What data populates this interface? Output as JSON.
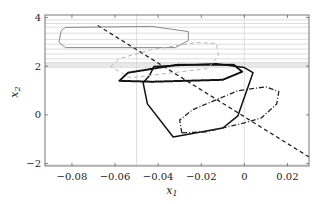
{
  "chart_data": {
    "type": "line",
    "title": "",
    "xlabel": "x_1",
    "ylabel": "x_2",
    "xlim": [
      -0.0925,
      0.03
    ],
    "ylim": [
      -2.1,
      4.1
    ],
    "grid": false,
    "legend": null,
    "x_ticks": [
      "−0.08",
      "−0.06",
      "−0.04",
      "−0.02",
      "0",
      "0.02"
    ],
    "x_tick_values": [
      -0.08,
      -0.06,
      -0.04,
      -0.02,
      0,
      0.02
    ],
    "y_ticks": [
      "−2",
      "0",
      "2",
      "4"
    ],
    "y_tick_values": [
      -2,
      0,
      2,
      4
    ],
    "series": [
      {
        "name": "black solid polygon",
        "style": "solid",
        "color": "#111111",
        "closed": true,
        "points": [
          [
            -0.042,
            1.98
          ],
          [
            -0.013,
            2.1
          ],
          [
            0.0,
            1.94
          ],
          [
            0.004,
            1.73
          ],
          [
            -0.003,
            -0.04
          ],
          [
            -0.01,
            -0.54
          ],
          [
            -0.033,
            -0.91
          ],
          [
            -0.045,
            0.45
          ],
          [
            -0.047,
            1.32
          ],
          [
            -0.044,
            1.61
          ]
        ]
      },
      {
        "name": "black dotted polygon",
        "style": "dotted",
        "color": "#111111",
        "closed": true,
        "points": [
          [
            -0.058,
            1.4
          ],
          [
            -0.054,
            1.73
          ],
          [
            -0.031,
            2.06
          ],
          [
            -0.005,
            2.06
          ],
          [
            -0.001,
            1.77
          ],
          [
            -0.01,
            1.44
          ],
          [
            -0.043,
            1.36
          ]
        ]
      },
      {
        "name": "dash-dot polygon",
        "style": "dashdot",
        "color": "#222222",
        "closed": true,
        "points": [
          [
            -0.029,
            -0.74
          ],
          [
            -0.03,
            -0.21
          ],
          [
            -0.024,
            0.21
          ],
          [
            -0.003,
            0.99
          ],
          [
            0.01,
            1.15
          ],
          [
            0.016,
            0.95
          ],
          [
            0.015,
            0.45
          ],
          [
            0.008,
            -0.12
          ],
          [
            0.0,
            -0.33
          ],
          [
            -0.018,
            -0.7
          ]
        ]
      },
      {
        "name": "dashed line",
        "style": "dashed",
        "color": "#222222",
        "closed": false,
        "points": [
          [
            -0.068,
            3.67
          ],
          [
            0.03,
            -1.73
          ]
        ]
      },
      {
        "name": "gray solid rounded polygon",
        "style": "solid",
        "color": "#8a8a8a",
        "closed": true,
        "points": [
          [
            -0.083,
            3.59
          ],
          [
            -0.043,
            3.63
          ],
          [
            -0.026,
            3.42
          ],
          [
            -0.026,
            3.05
          ],
          [
            -0.032,
            2.76
          ],
          [
            -0.083,
            2.76
          ],
          [
            -0.086,
            2.97
          ],
          [
            -0.085,
            3.46
          ]
        ]
      },
      {
        "name": "light gray dashed polygon",
        "style": "dashed",
        "color": "#b8b8b8",
        "closed": true,
        "points": [
          [
            -0.062,
            1.98
          ],
          [
            -0.058,
            2.31
          ],
          [
            -0.043,
            2.68
          ],
          [
            -0.022,
            2.97
          ],
          [
            -0.013,
            2.93
          ],
          [
            -0.012,
            2.43
          ],
          [
            -0.017,
            1.9
          ],
          [
            -0.053,
            1.52
          ]
        ]
      }
    ],
    "background_lines": {
      "color": "#d0d0d0",
      "horizontal_y": [
        3.9,
        3.75,
        3.6,
        3.35,
        3.1,
        2.9,
        2.7,
        2.5,
        2.3,
        2.15,
        2.1,
        2.05,
        2.0,
        1.95,
        -2.05
      ],
      "vertical_x": [
        -0.05,
        0.0
      ]
    }
  }
}
